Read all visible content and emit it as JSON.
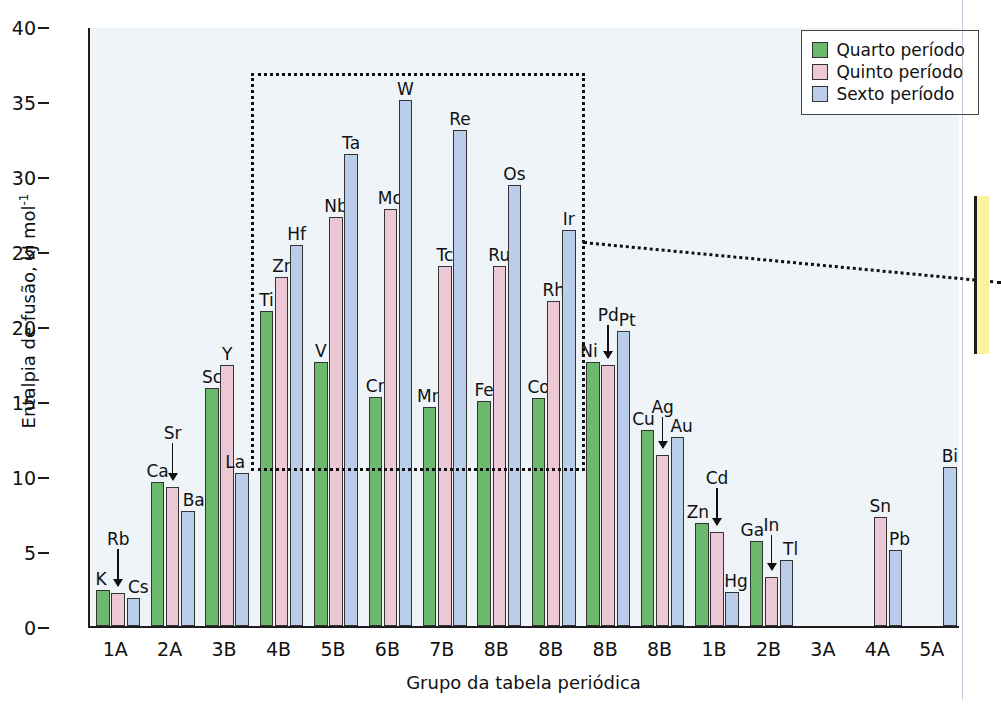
{
  "chart_data": {
    "type": "bar",
    "title": "",
    "xlabel": "Grupo da tabela periódica",
    "ylabel": "Entalpia de fusão, kJ mol⁻¹",
    "ylim": [
      0,
      40
    ],
    "yticks": [
      0,
      5,
      10,
      15,
      20,
      25,
      30,
      35,
      40
    ],
    "grid": false,
    "legend_position": "top-right",
    "categories": [
      "1A",
      "2A",
      "3B",
      "4B",
      "5B",
      "6B",
      "7B",
      "8B",
      "8B",
      "8B",
      "8B",
      "1B",
      "2B",
      "3A",
      "4A",
      "5A"
    ],
    "series": [
      {
        "name": "Quarto período",
        "color": "#6cb86c",
        "values": [
          2.4,
          9.6,
          15.9,
          21.0,
          17.6,
          15.3,
          14.6,
          15.0,
          15.2,
          17.6,
          13.1,
          6.9,
          5.7,
          null,
          null,
          null
        ],
        "element_labels": [
          "K",
          "Ca",
          "Sc",
          "Ti",
          "V",
          "Cr",
          "Mn",
          "Fe",
          "Co",
          "Ni",
          "Cu",
          "Zn",
          "Ga",
          null,
          null,
          null
        ]
      },
      {
        "name": "Quinto período",
        "color": "#ebc8d4",
        "values": [
          2.2,
          9.3,
          17.4,
          23.3,
          27.3,
          27.8,
          24.0,
          24.0,
          21.7,
          17.4,
          11.4,
          6.3,
          3.3,
          null,
          7.3,
          null
        ],
        "element_labels": [
          "Rb",
          "Sr",
          "Y",
          "Zr",
          "Nb",
          "Mo",
          "Tc",
          "Ru",
          "Rh",
          "Pd",
          "Ag",
          "Cd",
          "In",
          null,
          "Sn",
          null
        ]
      },
      {
        "name": "Sexto período",
        "color": "#bacdea",
        "values": [
          1.9,
          7.7,
          10.2,
          25.4,
          31.5,
          35.1,
          33.1,
          29.4,
          26.4,
          19.7,
          12.6,
          2.3,
          4.4,
          null,
          5.1,
          10.6
        ],
        "element_labels": [
          "Cs",
          "Ba",
          "La",
          "Hf",
          "Ta",
          "W",
          "Re",
          "Os",
          "Ir",
          "Pt",
          "Au",
          "Hg",
          "Tl",
          null,
          "Pb",
          "Bi"
        ]
      }
    ],
    "arrow_annotated_labels": [
      "Rb",
      "Sr",
      "Pd",
      "Ag",
      "Cd",
      "In"
    ],
    "highlight_box": {
      "note": "dotted rectangle enclosing transition-metal groups 4B through 8B",
      "x_range": [
        "4B",
        "8B"
      ],
      "y_range": [
        10.5,
        37.0
      ]
    }
  },
  "legend": {
    "items": [
      {
        "label": "Quarto período",
        "color": "#6cb86c"
      },
      {
        "label": "Quinto período",
        "color": "#ebc8d4"
      },
      {
        "label": "Sexto período",
        "color": "#bacdea"
      }
    ]
  },
  "axis": {
    "y_title_main": "Entalpia de fusão, kJ mol",
    "y_title_sup": "-1",
    "x_title": "Grupo da tabela periódica"
  },
  "ghost_lines": [
    {
      "x": 330,
      "y": 40,
      "text": "s, em uma rede cristalina. O magnésio"
    },
    {
      "x": 330,
      "y": 62,
      "text": "se metal muito mais duro, com um ponto"
    },
    {
      "x": 330,
      "y": 84,
      "text": "is alto. Os metais de transição são mais"
    },
    {
      "x": 110,
      "y": 106,
      "text": "ornar o metal ou os compostos metálicos mais estruturais e de"
    },
    {
      "x": 110,
      "y": 128,
      "text": "aplicação de metais e ligas, sendo mais frequentemente"
    },
    {
      "x": 110,
      "y": 150,
      "text": "conduzir eletricidade e calor, por exemplo, aplica-se"
    },
    {
      "x": 110,
      "y": 172,
      "text": "da estrutura metálica, tornando-a também mais"
    },
    {
      "x": 110,
      "y": 194,
      "text": "le poderá responder a altas temperaturas e pressões"
    },
    {
      "x": 110,
      "y": 216,
      "text": "ão. A série de aços inoxidáveis apresenta também uma"
    },
    {
      "x": 110,
      "y": 238,
      "text": "m desses átomos e a estrutura resultante tem volume"
    },
    {
      "x": 110,
      "y": 260,
      "text": "nossos aparelhos domésticos e equipamentos"
    },
    {
      "x": 110,
      "y": 282,
      "text": "utilizados nas indústrias. A liga metálica é um material"
    },
    {
      "x": 110,
      "y": 304,
      "text": "mente para aumentar a resistência à corrosão e"
    },
    {
      "x": 110,
      "y": 326,
      "text": "mais resistente e mais dúctil que o metal puro"
    }
  ]
}
